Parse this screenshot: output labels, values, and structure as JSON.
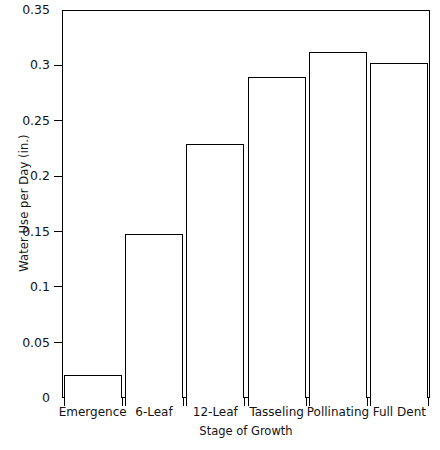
{
  "chart_data": {
    "type": "bar",
    "title": "",
    "xlabel": "Stage of Growth",
    "ylabel": "Water Use per Day (in.)",
    "categories": [
      "Emergence",
      "6-Leaf",
      "12-Leaf",
      "Tasseling",
      "Pollinating",
      "Full Dent"
    ],
    "values": [
      0.021,
      0.148,
      0.229,
      0.29,
      0.312,
      0.302
    ],
    "ylim": [
      0,
      0.35
    ],
    "yticks": [
      0,
      0.05,
      0.1,
      0.15,
      0.2,
      0.25,
      0.3,
      0.35
    ],
    "ytick_labels": [
      "0",
      "0.05",
      "0.1",
      "0.15",
      "0.2",
      "0.25",
      "0.3",
      "0.35"
    ],
    "grid": false,
    "legend": null,
    "bar_face_color": "#ffffff",
    "bar_edge_color": "#000000",
    "axis_color": "#000000",
    "background_color": "#ffffff"
  }
}
